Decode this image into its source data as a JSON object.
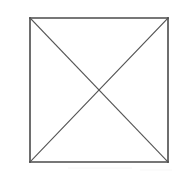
{
  "canvas": {
    "width": 182,
    "height": 175,
    "background_color": "#ffffff",
    "name": "scanned-line-figure"
  },
  "figure": {
    "description": "A plain square outline containing two straight diagonal lines joining opposite corners, crossing at the center to form an X.",
    "shape_type": "square-with-diagonals",
    "stroke_color_border": "#4a4a4a",
    "stroke_color_diagonal": "#555555",
    "fill_color": "#ffffff",
    "border_width": 1.6,
    "diagonal_width": 1.1
  },
  "square": {
    "name": "outer-square",
    "left": 30,
    "top": 18,
    "right": 168,
    "bottom": 162,
    "width": 138,
    "height": 144,
    "corners": {
      "top_left": [
        30,
        18
      ],
      "top_right": [
        168,
        18
      ],
      "bottom_right": [
        168,
        162
      ],
      "bottom_left": [
        30,
        162
      ]
    }
  },
  "edges": [
    {
      "name": "top-edge",
      "from": [
        30,
        18
      ],
      "to": [
        168,
        18
      ]
    },
    {
      "name": "right-edge",
      "from": [
        168,
        18
      ],
      "to": [
        168,
        162
      ]
    },
    {
      "name": "bottom-edge",
      "from": [
        168,
        162
      ],
      "to": [
        30,
        162
      ]
    },
    {
      "name": "left-edge",
      "from": [
        30,
        162
      ],
      "to": [
        30,
        18
      ]
    }
  ],
  "diagonals": [
    {
      "name": "diagonal-top-left-to-bottom-right",
      "from": [
        30,
        18
      ],
      "to": [
        168,
        162
      ]
    },
    {
      "name": "diagonal-top-right-to-bottom-left",
      "from": [
        168,
        18
      ],
      "to": [
        30,
        162
      ]
    }
  ],
  "intersection": {
    "name": "diagonal-intersection-point",
    "x": 99,
    "y": 90,
    "label": ""
  },
  "artifacts": {
    "scan_noise_visible": true,
    "noise_band_top": 165,
    "noise_color": "#e8e8e8"
  }
}
